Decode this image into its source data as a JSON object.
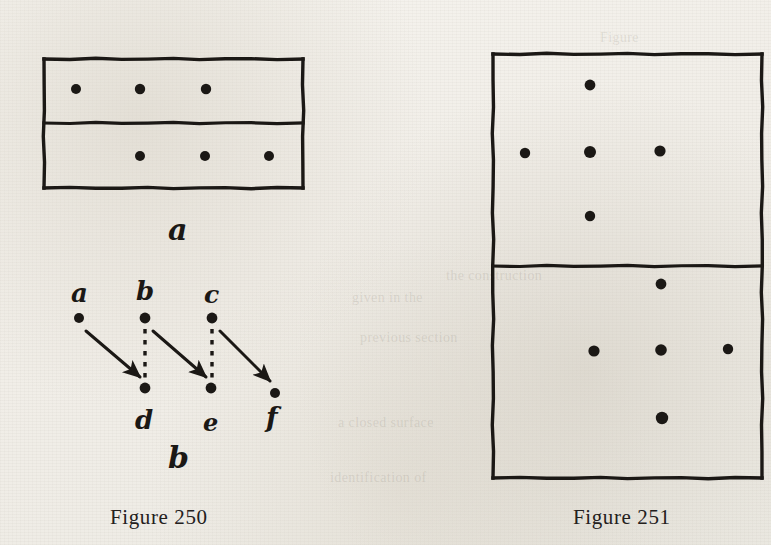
{
  "page": {
    "background_color": "#f3f1ec",
    "ink_color": "#1b1815",
    "ghost_text": [
      "the construction",
      "given in the",
      "previous section",
      "a closed surface",
      "Figure",
      "identification of"
    ]
  },
  "figures": [
    {
      "id": "figure-250",
      "caption": "Figure 250",
      "caption_x": 110,
      "caption_y": 505,
      "parts": [
        {
          "id": "part-a",
          "label": "a",
          "label_x": 168,
          "label_y": 212,
          "type": "divided-rectangle",
          "rect": {
            "x": 44,
            "y": 59,
            "width": 259,
            "height": 129
          },
          "divider_y": 123,
          "dots": [
            {
              "cx": 76,
              "cy": 89,
              "r": 5.0
            },
            {
              "cx": 140,
              "cy": 89,
              "r": 5.2
            },
            {
              "cx": 206,
              "cy": 89,
              "r": 5.2
            },
            {
              "cx": 140,
              "cy": 156,
              "r": 5.0
            },
            {
              "cx": 205,
              "cy": 156,
              "r": 5.0
            },
            {
              "cx": 269,
              "cy": 156,
              "r": 5.0
            }
          ]
        },
        {
          "id": "part-b",
          "label": "b",
          "label_x": 168,
          "label_y": 440,
          "type": "mapping-diagram",
          "nodes": [
            {
              "name": "a",
              "cx": 79,
              "cy": 318,
              "r": 5.0,
              "label_x": 71,
              "label_y": 278,
              "label_size": 26
            },
            {
              "name": "b",
              "cx": 145,
              "cy": 318,
              "r": 5.4,
              "label_x": 136,
              "label_y": 276,
              "label_size": 26
            },
            {
              "name": "c",
              "cx": 212,
              "cy": 318,
              "r": 5.4,
              "label_x": 204,
              "label_y": 280,
              "label_size": 25
            },
            {
              "name": "d",
              "cx": 145,
              "cy": 388,
              "r": 5.4,
              "label_x": 135,
              "label_y": 405,
              "label_size": 26
            },
            {
              "name": "e",
              "cx": 211,
              "cy": 388,
              "r": 5.4,
              "label_x": 203,
              "label_y": 408,
              "label_size": 24
            },
            {
              "name": "f",
              "cx": 275,
              "cy": 393,
              "r": 5.0,
              "label_x": 266,
              "label_y": 402,
              "label_size": 27
            }
          ],
          "arrows": [
            {
              "from": "a",
              "to": "d",
              "x1": 86,
              "y1": 331,
              "x2": 140,
              "y2": 377
            },
            {
              "from": "b",
              "to": "e",
              "x1": 153,
              "y1": 331,
              "x2": 206,
              "y2": 377
            },
            {
              "from": "c",
              "to": "f",
              "x1": 220,
              "y1": 331,
              "x2": 270,
              "y2": 381
            }
          ],
          "dashed_links": [
            {
              "from": "b",
              "to": "d",
              "x1": 145,
              "y1": 329,
              "x2": 145,
              "y2": 378
            },
            {
              "from": "c",
              "to": "e",
              "x1": 212,
              "y1": 329,
              "x2": 212,
              "y2": 378
            }
          ]
        }
      ]
    },
    {
      "id": "figure-251",
      "caption": "Figure 251",
      "caption_x": 573,
      "caption_y": 505,
      "type": "divided-rectangle",
      "rect": {
        "x": 493,
        "y": 54,
        "width": 269,
        "height": 424
      },
      "divider_y": 266,
      "dots": [
        {
          "cx": 590,
          "cy": 85,
          "r": 5.4
        },
        {
          "cx": 525,
          "cy": 153,
          "r": 5.2
        },
        {
          "cx": 590,
          "cy": 152,
          "r": 6.0
        },
        {
          "cx": 660,
          "cy": 151,
          "r": 5.6
        },
        {
          "cx": 590,
          "cy": 216,
          "r": 5.2
        },
        {
          "cx": 661,
          "cy": 284,
          "r": 5.4
        },
        {
          "cx": 594,
          "cy": 351,
          "r": 5.6
        },
        {
          "cx": 661,
          "cy": 350,
          "r": 5.8
        },
        {
          "cx": 728,
          "cy": 349,
          "r": 5.2
        },
        {
          "cx": 662,
          "cy": 418,
          "r": 6.2
        }
      ]
    }
  ]
}
